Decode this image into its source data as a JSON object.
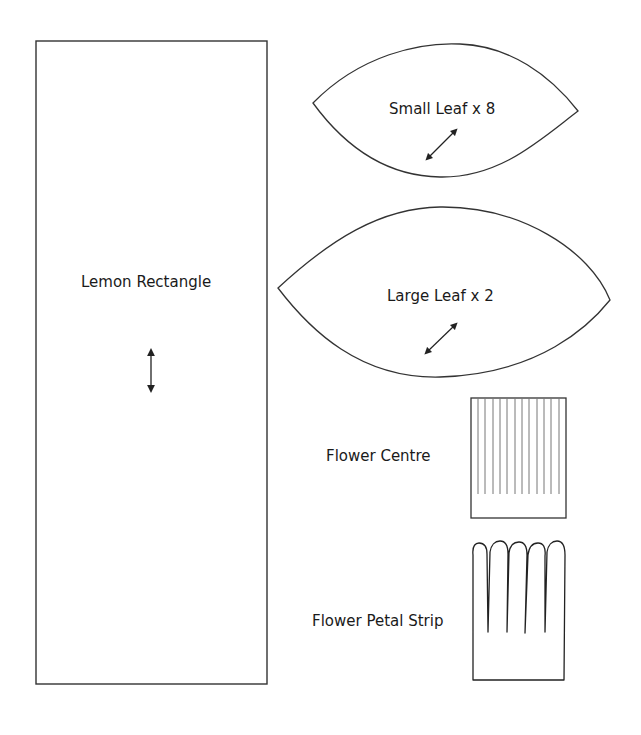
{
  "colors": {
    "stroke": "#333333",
    "text": "#1a1a1a",
    "background": "#ffffff"
  },
  "pieces": {
    "lemon_rectangle": {
      "label": "Lemon Rectangle",
      "grain_arrow": "vertical-double-arrow"
    },
    "small_leaf": {
      "label": "Small Leaf x 8",
      "grain_arrow": "diagonal-double-arrow"
    },
    "large_leaf": {
      "label": "Large Leaf x 2",
      "grain_arrow": "diagonal-double-arrow"
    },
    "flower_centre": {
      "label": "Flower Centre",
      "fringe_cuts": 12
    },
    "flower_petal_strip": {
      "label": "Flower Petal Strip",
      "petals": 5
    }
  }
}
